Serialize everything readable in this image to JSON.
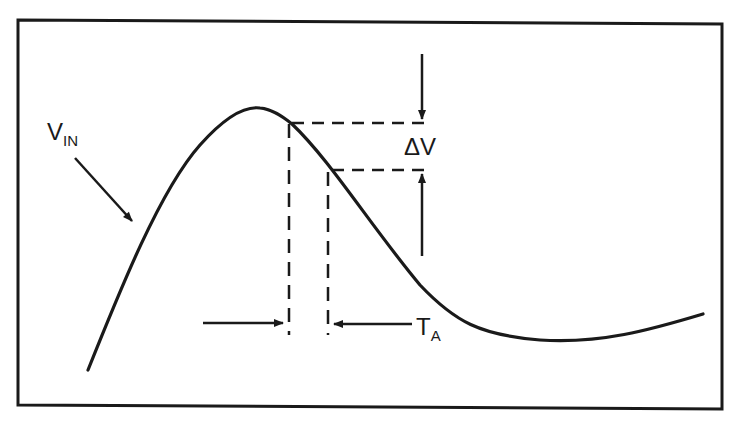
{
  "figure": {
    "type": "waveform-timing-diagram",
    "colors": {
      "ink": "#1a1a1a",
      "background": "#ffffff"
    }
  },
  "labels": {
    "vin": {
      "main": "V",
      "sub": "IN"
    },
    "delta_v": "ΔV",
    "ta": {
      "main": "T",
      "sub": "A"
    }
  },
  "elements": {
    "curve": "V_IN input waveform",
    "dashed_lines": [
      "sample-start level",
      "sample-end level",
      "sample-start time",
      "sample-end time"
    ],
    "arrows": [
      "vin pointer",
      "ΔV top arrow",
      "ΔV bottom arrow",
      "T_A left arrow",
      "T_A right arrow"
    ]
  }
}
